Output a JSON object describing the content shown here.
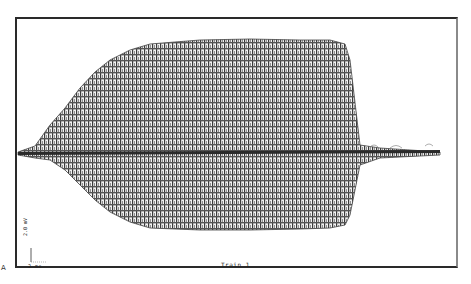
{
  "chart_data": {
    "type": "line",
    "title": "",
    "caption": "Train 1",
    "panel_label": "A",
    "xlabel": "",
    "ylabel": "",
    "grid": false,
    "legend": null,
    "scale_bars": {
      "vertical": {
        "value": 2.0,
        "unit": "mV",
        "label": "2.0 mV"
      },
      "horizontal": {
        "value": 2,
        "unit": "ms",
        "label": "2 ms"
      }
    },
    "envelope": {
      "x_px": [
        18,
        35,
        50,
        65,
        80,
        95,
        110,
        130,
        150,
        200,
        250,
        300,
        330,
        345,
        350,
        360,
        380,
        440
      ],
      "upper_y_px": [
        152,
        146,
        125,
        108,
        88,
        72,
        60,
        50,
        44,
        40,
        39,
        40,
        40,
        44,
        60,
        145,
        148,
        152
      ],
      "lower_y_px": [
        155,
        158,
        160,
        170,
        185,
        200,
        212,
        222,
        228,
        230,
        230,
        229,
        228,
        225,
        215,
        165,
        158,
        155
      ],
      "baseline_y_px": 152
    }
  },
  "labels": {
    "caption": "Train 1",
    "panel": "A",
    "scale_y": "2.0 mV",
    "scale_x": "2 ms"
  },
  "colors": {
    "frame": "#2a2a2a",
    "trace": "#3a3a3a",
    "background": "#ffffff"
  }
}
